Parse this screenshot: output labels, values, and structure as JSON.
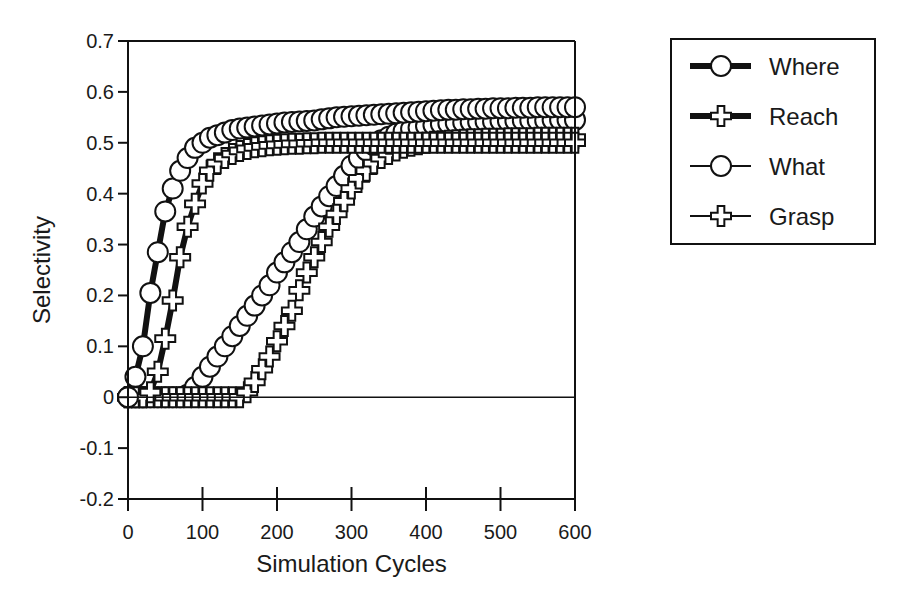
{
  "chart_data": {
    "type": "line",
    "title": "",
    "xlabel": "Simulation Cycles",
    "ylabel": "Selectivity",
    "xlim": [
      0,
      600
    ],
    "ylim": [
      -0.2,
      0.7
    ],
    "xticks": [
      0,
      100,
      200,
      300,
      400,
      500,
      600
    ],
    "xtick_labels": [
      "0",
      "100",
      "200",
      "300",
      "400",
      "500",
      "600"
    ],
    "yticks": [
      -0.2,
      -0.1,
      0,
      0.1,
      0.2,
      0.3,
      0.4,
      0.5,
      0.6,
      0.7
    ],
    "ytick_labels": [
      "-0.2",
      "-0.1",
      "0",
      "0.1",
      "0.2",
      "0.3",
      "0.4",
      "0.5",
      "0.6",
      "0.7"
    ],
    "grid": false,
    "zero_line": true,
    "legend_position": "right-outside-top",
    "x": [
      0,
      10,
      20,
      30,
      40,
      50,
      60,
      70,
      80,
      90,
      100,
      110,
      120,
      130,
      140,
      150,
      160,
      170,
      180,
      190,
      200,
      210,
      220,
      230,
      240,
      250,
      260,
      270,
      280,
      290,
      300,
      310,
      320,
      330,
      340,
      350,
      360,
      370,
      380,
      390,
      400,
      410,
      420,
      430,
      440,
      450,
      460,
      470,
      480,
      490,
      500,
      510,
      520,
      530,
      540,
      550,
      560,
      570,
      580,
      590,
      600
    ],
    "series": [
      {
        "name": "Where",
        "marker": "circle",
        "line": "thick",
        "values": [
          0.0,
          0.04,
          0.1,
          0.205,
          0.285,
          0.365,
          0.41,
          0.445,
          0.47,
          0.49,
          0.5,
          0.51,
          0.515,
          0.52,
          0.525,
          0.528,
          0.53,
          0.532,
          0.534,
          0.536,
          0.538,
          0.54,
          0.541,
          0.542,
          0.543,
          0.544,
          0.546,
          0.548,
          0.55,
          0.551,
          0.552,
          0.553,
          0.554,
          0.555,
          0.556,
          0.557,
          0.558,
          0.559,
          0.56,
          0.561,
          0.562,
          0.563,
          0.564,
          0.565,
          0.565,
          0.566,
          0.566,
          0.567,
          0.567,
          0.568,
          0.568,
          0.568,
          0.569,
          0.569,
          0.569,
          0.57,
          0.57,
          0.57,
          0.57,
          0.57,
          0.57
        ]
      },
      {
        "name": "Reach",
        "marker": "cross",
        "line": "thick",
        "values": [
          0.0,
          0.0,
          0.0,
          0.01,
          0.05,
          0.115,
          0.19,
          0.275,
          0.335,
          0.38,
          0.42,
          0.445,
          0.46,
          0.47,
          0.478,
          0.484,
          0.488,
          0.491,
          0.493,
          0.495,
          0.496,
          0.497,
          0.498,
          0.498,
          0.499,
          0.499,
          0.5,
          0.5,
          0.5,
          0.5,
          0.5,
          0.5,
          0.5,
          0.5,
          0.5,
          0.5,
          0.5,
          0.5,
          0.5,
          0.5,
          0.5,
          0.5,
          0.5,
          0.5,
          0.5,
          0.5,
          0.5,
          0.5,
          0.5,
          0.5,
          0.5,
          0.5,
          0.5,
          0.5,
          0.5,
          0.5,
          0.5,
          0.5,
          0.5,
          0.5,
          0.5
        ]
      },
      {
        "name": "What",
        "marker": "circle",
        "line": "thin",
        "values": [
          0.0,
          0.0,
          0.0,
          0.0,
          0.0,
          0.0,
          0.0,
          0.0,
          0.005,
          0.02,
          0.04,
          0.06,
          0.08,
          0.1,
          0.12,
          0.14,
          0.16,
          0.18,
          0.2,
          0.22,
          0.245,
          0.265,
          0.285,
          0.305,
          0.33,
          0.355,
          0.375,
          0.395,
          0.415,
          0.435,
          0.455,
          0.47,
          0.485,
          0.495,
          0.505,
          0.512,
          0.518,
          0.523,
          0.527,
          0.53,
          0.533,
          0.535,
          0.537,
          0.538,
          0.539,
          0.54,
          0.541,
          0.541,
          0.542,
          0.542,
          0.543,
          0.543,
          0.543,
          0.544,
          0.544,
          0.544,
          0.544,
          0.545,
          0.545,
          0.545,
          0.545
        ]
      },
      {
        "name": "Grasp",
        "marker": "cross",
        "line": "thin",
        "values": [
          0.0,
          0.0,
          0.0,
          0.0,
          0.0,
          0.0,
          0.0,
          0.0,
          0.0,
          0.0,
          0.0,
          0.0,
          0.0,
          0.0,
          0.0,
          0.0,
          0.01,
          0.03,
          0.055,
          0.08,
          0.11,
          0.14,
          0.17,
          0.21,
          0.245,
          0.275,
          0.305,
          0.335,
          0.36,
          0.385,
          0.41,
          0.43,
          0.445,
          0.46,
          0.47,
          0.478,
          0.485,
          0.49,
          0.494,
          0.497,
          0.5,
          0.502,
          0.503,
          0.504,
          0.505,
          0.506,
          0.507,
          0.507,
          0.508,
          0.508,
          0.508,
          0.509,
          0.509,
          0.509,
          0.509,
          0.51,
          0.51,
          0.51,
          0.51,
          0.51,
          0.51
        ]
      }
    ]
  },
  "legend": {
    "items": [
      {
        "label": "Where"
      },
      {
        "label": "Reach"
      },
      {
        "label": "What"
      },
      {
        "label": "Grasp"
      }
    ]
  }
}
